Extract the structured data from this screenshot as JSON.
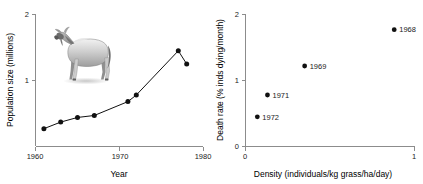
{
  "figure": {
    "panels": [
      "population-time-series",
      "density-death-rate-scatter"
    ]
  },
  "left_panel": {
    "y_axis_title": "Population size (millions)",
    "x_axis_title": "Year",
    "y_ticks": [
      "1",
      "2"
    ],
    "x_ticks": [
      "1960",
      "1970",
      "1980"
    ],
    "illustration": "wildebeest-illustration"
  },
  "right_panel": {
    "y_axis_title": "Death rate (% inds dying/month)",
    "x_axis_title": "Density (individuals/kg grass/ha/day)",
    "y_ticks": [
      "0",
      "1",
      "2"
    ],
    "x_ticks": [
      "0",
      "1"
    ],
    "point_labels": [
      "1968",
      "1969",
      "1971",
      "1972"
    ]
  },
  "chart_data": [
    {
      "type": "line",
      "title": "",
      "xlabel": "Year",
      "ylabel": "Population size (millions)",
      "xlim": [
        1960,
        1980
      ],
      "ylim": [
        0,
        2
      ],
      "xticks": [
        1960,
        1970,
        1980
      ],
      "yticks": [
        1,
        2
      ],
      "grid": false,
      "legend": "none",
      "markers": true,
      "x": [
        1961,
        1963,
        1965,
        1967,
        1971,
        1972,
        1977,
        1978
      ],
      "y": [
        0.27,
        0.37,
        0.44,
        0.47,
        0.68,
        0.78,
        1.45,
        1.25
      ],
      "series": [
        {
          "name": "Wildebeest population size",
          "points": [
            {
              "x": 1961,
              "y": 0.27
            },
            {
              "x": 1963,
              "y": 0.37
            },
            {
              "x": 1965,
              "y": 0.44
            },
            {
              "x": 1967,
              "y": 0.47
            },
            {
              "x": 1971,
              "y": 0.68
            },
            {
              "x": 1972,
              "y": 0.78
            },
            {
              "x": 1977,
              "y": 1.45
            },
            {
              "x": 1978,
              "y": 1.25
            }
          ]
        }
      ]
    },
    {
      "type": "scatter",
      "title": "",
      "xlabel": "Density (individuals/kg grass/ha/day)",
      "ylabel": "Death rate (% inds dying/month)",
      "xlim": [
        0,
        1
      ],
      "ylim": [
        0,
        2
      ],
      "xticks": [
        0,
        1
      ],
      "yticks": [
        0,
        1,
        2
      ],
      "grid": false,
      "legend": "none",
      "points": [
        {
          "label": "1972",
          "x": 0.07,
          "y": 0.45
        },
        {
          "label": "1971",
          "x": 0.13,
          "y": 0.78
        },
        {
          "label": "1969",
          "x": 0.35,
          "y": 1.22
        },
        {
          "label": "1968",
          "x": 0.88,
          "y": 1.77
        }
      ]
    }
  ]
}
